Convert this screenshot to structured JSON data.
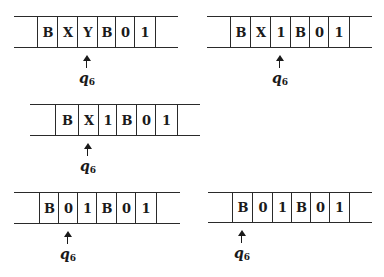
{
  "figure": {
    "tapes": [
      {
        "id": "tape-1",
        "symbols": [
          "B",
          "X",
          "Y",
          "B",
          "0",
          "1"
        ],
        "head_cell_index": 2,
        "state": "q",
        "state_subscript": "6"
      },
      {
        "id": "tape-2",
        "symbols": [
          "B",
          "X",
          "1",
          "B",
          "0",
          "1"
        ],
        "head_cell_index": 2,
        "state": "q",
        "state_subscript": "6"
      },
      {
        "id": "tape-3",
        "symbols": [
          "B",
          "X",
          "1",
          "B",
          "0",
          "1"
        ],
        "head_cell_index": 1,
        "state": "q",
        "state_subscript": "6"
      },
      {
        "id": "tape-4",
        "symbols": [
          "B",
          "0",
          "1",
          "B",
          "0",
          "1"
        ],
        "head_cell_index": 1,
        "state": "q",
        "state_subscript": "6"
      },
      {
        "id": "tape-5",
        "symbols": [
          "B",
          "0",
          "1",
          "B",
          "0",
          "1"
        ],
        "head_cell_index": 0,
        "state": "q",
        "state_subscript": "6"
      }
    ]
  }
}
